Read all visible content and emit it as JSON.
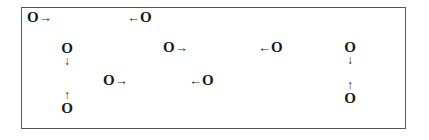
{
  "diagram": {
    "symbol": "O",
    "arrows": {
      "right": "→",
      "left": "←",
      "down": "↓",
      "up": "↑"
    },
    "items": [
      {
        "id": "o1",
        "text": "O",
        "arrow": "→",
        "direction": "right"
      },
      {
        "id": "o2",
        "text": "O",
        "arrow": "←",
        "direction": "left"
      },
      {
        "id": "o3",
        "text": "O",
        "arrow": "↓",
        "direction": "down"
      },
      {
        "id": "o4",
        "text": "O",
        "arrow": "→",
        "direction": "right"
      },
      {
        "id": "o5",
        "text": "O",
        "arrow": "←",
        "direction": "left"
      },
      {
        "id": "o6",
        "text": "O",
        "arrow": "↓",
        "direction": "down"
      },
      {
        "id": "o7",
        "text": "O",
        "arrow": "→",
        "direction": "right"
      },
      {
        "id": "o8",
        "text": "O",
        "arrow": "←",
        "direction": "left"
      },
      {
        "id": "o9",
        "text": "O",
        "arrow": "↑",
        "direction": "up"
      },
      {
        "id": "o10",
        "text": "O",
        "arrow": "↑",
        "direction": "up"
      }
    ]
  }
}
